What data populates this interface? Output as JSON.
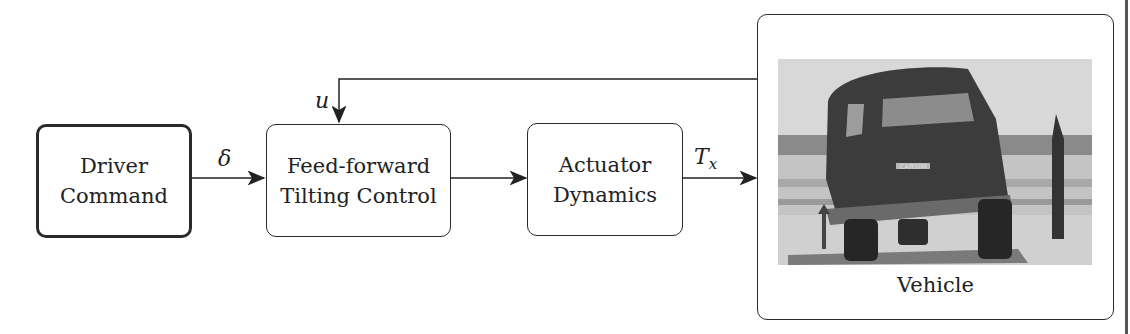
{
  "blocks": {
    "driver_command": {
      "line1": "Driver",
      "line2": "Command"
    },
    "feedforward": {
      "line1": "Feed-forward",
      "line2": "Tilting Control"
    },
    "actuator": {
      "line1": "Actuator",
      "line2": "Dynamics"
    },
    "vehicle": {
      "caption": "Vehicle",
      "image_text": "CARSIM"
    }
  },
  "signals": {
    "delta": "δ",
    "u": "u",
    "tx": "T",
    "tx_sub": "x"
  }
}
